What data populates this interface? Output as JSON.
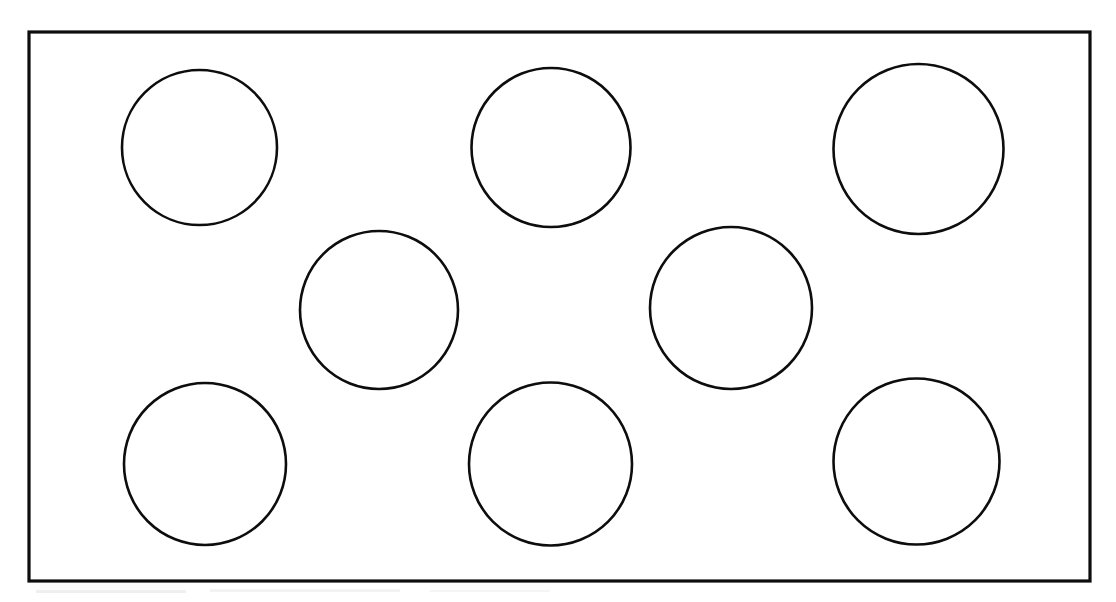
{
  "figure": {
    "background_color": "#ffffff",
    "stroke_color": "#0d0d0d",
    "canvas": {
      "width": 1116,
      "height": 602
    }
  },
  "plate": {
    "name": "outer-rectangle",
    "x": 29,
    "y": 32,
    "width": 1061,
    "height": 549,
    "stroke_width": 3.2
  },
  "holes": [
    {
      "label": "top-left-circle",
      "cx": 199.5,
      "cy": 147.5,
      "r": 77.5,
      "stroke_width": 2.6
    },
    {
      "label": "top-center-circle",
      "cx": 551.0,
      "cy": 147.5,
      "r": 79.5,
      "stroke_width": 2.6
    },
    {
      "label": "top-right-circle",
      "cx": 918.5,
      "cy": 149.0,
      "r": 85.0,
      "stroke_width": 2.6
    },
    {
      "label": "middle-left-circle",
      "cx": 379.0,
      "cy": 310.0,
      "r": 79.0,
      "stroke_width": 2.6
    },
    {
      "label": "middle-right-circle",
      "cx": 731.0,
      "cy": 308.0,
      "r": 81.0,
      "stroke_width": 2.6
    },
    {
      "label": "bottom-left-circle",
      "cx": 205.0,
      "cy": 464.0,
      "r": 81.0,
      "stroke_width": 2.6
    },
    {
      "label": "bottom-center-circle",
      "cx": 550.5,
      "cy": 464.0,
      "r": 81.5,
      "stroke_width": 2.6
    },
    {
      "label": "bottom-right-circle",
      "cx": 916.5,
      "cy": 461.5,
      "r": 83.0,
      "stroke_width": 2.6
    }
  ],
  "scan_artifacts": [
    {
      "label": "smudge-below-left",
      "x": 36,
      "y": 590,
      "width": 150,
      "height": 3,
      "opacity": 0.3
    },
    {
      "label": "smudge-below-center",
      "x": 210,
      "y": 589,
      "width": 190,
      "height": 3,
      "opacity": 0.22
    },
    {
      "label": "smudge-below-right",
      "x": 430,
      "y": 590,
      "width": 120,
      "height": 2,
      "opacity": 0.18
    }
  ]
}
